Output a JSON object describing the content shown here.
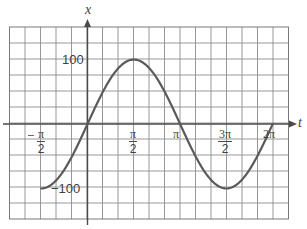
{
  "chart_data": {
    "type": "line",
    "title": "",
    "function": "x = 100 sin t",
    "xlabel": "t",
    "ylabel": "x",
    "x_range": [
      -1.5708,
      6.2832
    ],
    "ylim": [
      -100,
      100
    ],
    "grid": true,
    "x_ticks": [
      {
        "value": -1.5708,
        "label_num": "π",
        "label_den": "2",
        "negative": true,
        "label": "−π/2"
      },
      {
        "value": 1.5708,
        "label_num": "π",
        "label_den": "2",
        "negative": false,
        "label": "π/2"
      },
      {
        "value": 3.1416,
        "label": "π"
      },
      {
        "value": 4.7124,
        "label_num": "3π",
        "label_den": "2",
        "negative": false,
        "label": "3π/2"
      },
      {
        "value": 6.2832,
        "label": "2π"
      }
    ],
    "y_ticks": [
      {
        "value": 100,
        "label": "100"
      },
      {
        "value": -100,
        "label": "−100"
      }
    ],
    "series": [
      {
        "name": "x(t) = 100 sin t",
        "x": [
          -1.5708,
          -0.7854,
          0,
          0.7854,
          1.5708,
          2.3562,
          3.1416,
          3.927,
          4.7124,
          5.4978,
          6.2832
        ],
        "values": [
          -100,
          -70.7,
          0,
          70.7,
          100,
          70.7,
          0,
          -70.7,
          -100,
          -70.7,
          0
        ]
      }
    ],
    "key_points": [
      {
        "t": "−π/2",
        "x": -100
      },
      {
        "t": "0",
        "x": 0
      },
      {
        "t": "π/2",
        "x": 100
      },
      {
        "t": "π",
        "x": 0
      },
      {
        "t": "3π/2",
        "x": -100
      },
      {
        "t": "2π",
        "x": 0
      }
    ]
  },
  "labels": {
    "y_axis": "x",
    "x_axis": "t",
    "y_tick_top": "100",
    "y_tick_bottom": "−100",
    "tick_neg_half_pi_num": "π",
    "tick_neg_half_pi_den": "2",
    "tick_half_pi_num": "π",
    "tick_half_pi_den": "2",
    "tick_pi": "π",
    "tick_three_half_pi_num": "3π",
    "tick_three_half_pi_den": "2",
    "tick_two_pi": "2π"
  },
  "colors": {
    "grid": "#8c8c8c",
    "axis": "#4a4a4a",
    "curve": "#5a5a5a",
    "text": "#3f3f3f",
    "background": "#ffffff"
  }
}
